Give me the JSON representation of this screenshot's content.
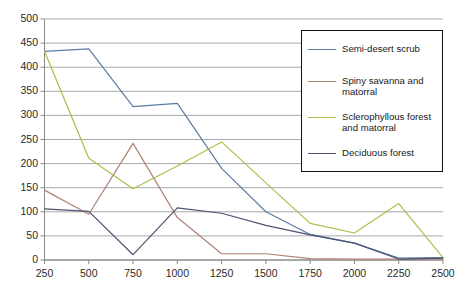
{
  "chart_data": {
    "type": "line",
    "title": "",
    "xlabel": "",
    "ylabel": "",
    "xlim": [
      250,
      2500
    ],
    "ylim": [
      0,
      500
    ],
    "grid": true,
    "legend_position": "top-right",
    "categories": [
      250,
      500,
      750,
      1000,
      1250,
      1500,
      1750,
      2000,
      2250,
      2500
    ],
    "x_tick_labels": [
      "250",
      "500",
      "750",
      "1000",
      "1250",
      "1500",
      "1750",
      "2000",
      "2250",
      "2500"
    ],
    "y_tick_labels": [
      "0",
      "50",
      "100",
      "150",
      "200",
      "250",
      "300",
      "350",
      "400",
      "450",
      "500"
    ],
    "y_ticks": [
      0,
      50,
      100,
      150,
      200,
      250,
      300,
      350,
      400,
      450,
      500
    ],
    "series": [
      {
        "name": "Semi-desert scrub",
        "color": "#5b7ca6",
        "values": [
          433,
          438,
          318,
          325,
          190,
          100,
          53,
          35,
          4,
          5
        ]
      },
      {
        "name": "Spiny savanna and matorral",
        "color": "#b08276",
        "values": [
          145,
          95,
          242,
          88,
          13,
          13,
          3,
          2,
          2,
          2
        ]
      },
      {
        "name": "Sclerophyllous forest and matorral",
        "color": "#a5c24a",
        "values": [
          433,
          211,
          148,
          195,
          245,
          160,
          76,
          56,
          117,
          5
        ]
      },
      {
        "name": "Deciduous forest",
        "color": "#4a5372",
        "values": [
          106,
          101,
          11,
          108,
          97,
          72,
          52,
          35,
          2,
          4
        ]
      }
    ]
  },
  "legend": {
    "items": [
      {
        "label": "Semi-desert scrub",
        "color": "#5b7ca6"
      },
      {
        "label": "Spiny savanna and matorral",
        "color": "#b08276"
      },
      {
        "label": "Sclerophyllous forest and matorral",
        "color": "#a5c24a"
      },
      {
        "label": "Deciduous forest",
        "color": "#4a5372"
      }
    ]
  },
  "axis": {
    "y_labels": [
      "500",
      "450",
      "400",
      "350",
      "300",
      "250",
      "200",
      "150",
      "100",
      "50",
      "0"
    ],
    "x_labels": [
      "250",
      "500",
      "750",
      "1000",
      "1250",
      "1500",
      "1750",
      "2000",
      "2250",
      "2500"
    ]
  }
}
